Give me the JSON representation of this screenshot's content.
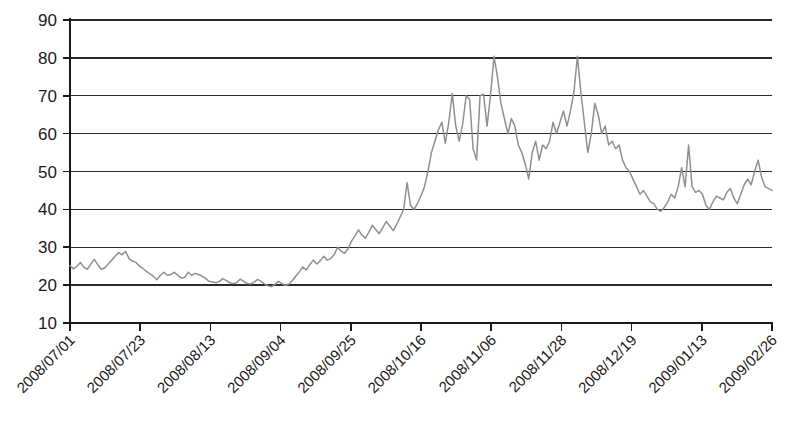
{
  "chart_data": {
    "type": "line",
    "title": "",
    "subtitle": "",
    "xlabel": "",
    "ylabel": "",
    "ylim": [
      10,
      90
    ],
    "ytick_values": [
      10,
      20,
      30,
      40,
      50,
      60,
      70,
      80,
      90
    ],
    "ytick_labels": [
      "10",
      "20",
      "30",
      "40",
      "50",
      "60",
      "70",
      "80",
      "90"
    ],
    "grid": true,
    "grid_axis": "y",
    "legend": false,
    "legend_position": "none",
    "xtick_labels": [
      "2008/07/01",
      "2008/07/23",
      "2008/08/13",
      "2008/09/04",
      "2008/09/25",
      "2008/10/16",
      "2008/11/06",
      "2008/11/28",
      "2008/12/19",
      "2009/01/13",
      "2009/02/26"
    ],
    "xtick_labels_full": [
      "2008/07/01",
      "2008/07/23",
      "2008/08/13",
      "2008/09/04",
      "2008/09/25",
      "2008/10/16",
      "2008/11/06",
      "2008/11/28",
      "2008/12/19",
      "2009/01/13",
      "2009/02/04",
      "2009/02/26"
    ],
    "xtick_rotation_deg": -45,
    "series_color": "#8f8f8f",
    "axis_color": "#1a1a1a",
    "grid_color": "#2b2b2b",
    "series": [
      {
        "name": "value",
        "x_start_label": "2008/07/01",
        "x_end_label": "2009/02/26",
        "n_points": 175,
        "y_min": 19.5,
        "y_max": 80.6,
        "values": [
          25.2,
          24.3,
          25.0,
          26.0,
          24.7,
          24.2,
          25.6,
          26.8,
          25.4,
          24.2,
          24.5,
          25.6,
          26.6,
          27.6,
          28.6,
          28.0,
          28.9,
          27.0,
          26.3,
          26.0,
          25.0,
          24.4,
          23.6,
          23.0,
          22.3,
          21.4,
          22.6,
          23.4,
          22.6,
          22.8,
          23.4,
          22.6,
          21.9,
          22.0,
          23.4,
          22.6,
          23.1,
          22.8,
          22.4,
          21.8,
          21.0,
          20.8,
          20.6,
          21.0,
          21.7,
          21.2,
          20.6,
          20.4,
          20.7,
          21.6,
          21.0,
          20.4,
          20.3,
          20.8,
          21.5,
          21.0,
          20.3,
          19.8,
          19.6,
          20.2,
          21.0,
          20.4,
          19.9,
          20.3,
          21.2,
          22.4,
          23.5,
          24.8,
          24.0,
          25.4,
          26.6,
          25.6,
          26.4,
          27.6,
          26.6,
          27.0,
          28.0,
          30.0,
          29.0,
          28.4,
          29.6,
          31.6,
          33.0,
          34.6,
          33.2,
          32.4,
          34.0,
          35.8,
          34.6,
          33.6,
          35.2,
          36.8,
          35.6,
          34.4,
          36.0,
          38.0,
          40.0,
          47.0,
          41.0,
          40.0,
          41.6,
          43.6,
          46.0,
          50.0,
          55.0,
          58.0,
          61.0,
          63.0,
          57.5,
          63.0,
          70.6,
          62.0,
          58.0,
          62.6,
          70.0,
          69.0,
          56.0,
          53.0,
          70.0,
          70.4,
          62.0,
          70.0,
          80.4,
          75.0,
          68.0,
          64.0,
          60.0,
          64.0,
          62.0,
          57.0,
          55.0,
          52.0,
          48.0,
          55.0,
          58.0,
          53.0,
          57.0,
          56.0,
          58.0,
          63.0,
          60.0,
          63.0,
          66.0,
          62.0,
          66.0,
          71.0,
          80.4,
          71.0,
          63.0,
          55.0,
          60.0,
          68.0,
          65.0,
          60.0,
          62.0,
          57.0,
          58.0,
          56.0,
          57.0,
          53.0,
          51.0,
          50.0,
          48.0,
          46.0,
          44.0,
          45.0,
          43.5,
          42.0,
          41.5,
          40.0,
          39.5,
          40.5,
          42.0,
          44.0,
          43.0,
          46.0,
          51.0,
          46.0,
          57.0,
          46.0,
          44.5,
          45.0,
          44.0,
          41.0,
          40.0,
          42.0,
          43.5,
          43.0,
          42.5,
          44.5,
          45.5,
          43.0,
          41.5,
          44.0,
          46.5,
          48.0,
          46.5,
          50.0,
          53.0,
          48.5,
          46.0,
          45.5,
          45.0
        ]
      }
    ],
    "annotations": []
  },
  "layout": {
    "plot_left_px": 70,
    "plot_right_px": 772,
    "plot_top_px": 20,
    "plot_bottom_px": 323
  }
}
